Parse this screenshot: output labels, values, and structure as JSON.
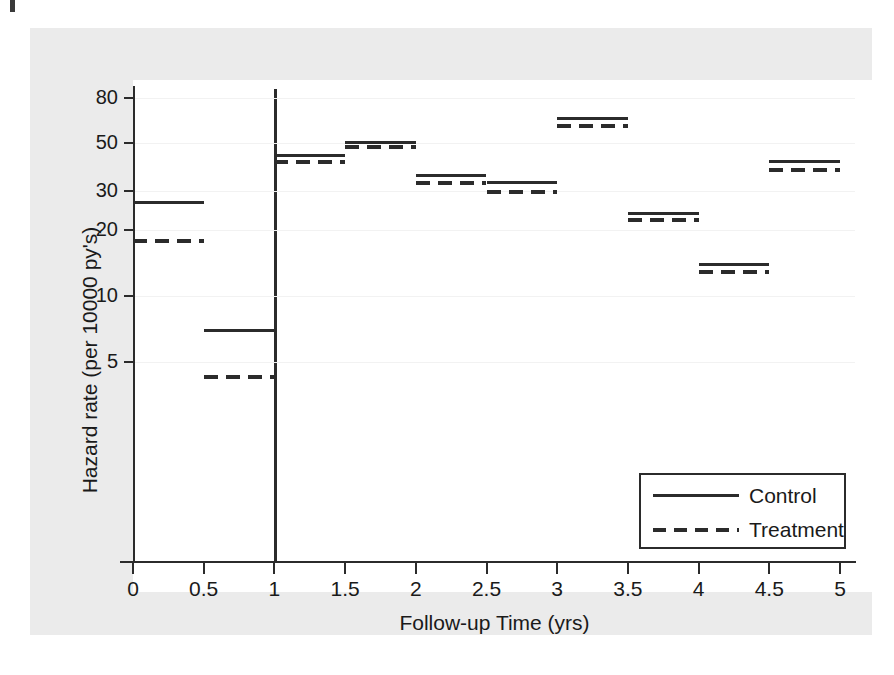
{
  "figure": {
    "background_color": "#ebebeb",
    "plot_background_color": "#ffffff",
    "ink_color": "#2b2b2b"
  },
  "chart_data": {
    "type": "line",
    "subtype": "step-hazard-piecewise",
    "title": "",
    "xlabel": "Follow-up Time (yrs)",
    "ylabel": "Hazard rate (per 10000 py's)",
    "yscale": "log",
    "xlim": [
      0,
      5
    ],
    "ylim": [
      4,
      95
    ],
    "grid": true,
    "x_ticks": [
      "0",
      "0.5",
      "1",
      "1.5",
      "2",
      "2.5",
      "3",
      "3.5",
      "4",
      "4.5",
      "5"
    ],
    "x_tick_values": [
      0,
      0.5,
      1,
      1.5,
      2,
      2.5,
      3,
      3.5,
      4,
      4.5,
      5
    ],
    "y_ticks": [
      "5",
      "10",
      "20",
      "30",
      "50",
      "80"
    ],
    "y_tick_values": [
      5,
      10,
      20,
      30,
      50,
      80
    ],
    "intervals": [
      {
        "start": 0,
        "end": 0.5
      },
      {
        "start": 0.5,
        "end": 1
      },
      {
        "start": 1,
        "end": 1.5
      },
      {
        "start": 1.5,
        "end": 2
      },
      {
        "start": 2,
        "end": 2.5
      },
      {
        "start": 2.5,
        "end": 3
      },
      {
        "start": 3,
        "end": 3.5
      },
      {
        "start": 3.5,
        "end": 4
      },
      {
        "start": 4,
        "end": 4.5
      },
      {
        "start": 4.5,
        "end": 5
      }
    ],
    "series": [
      {
        "name": "Control",
        "style": "solid",
        "values": [
          26.8,
          7.0,
          44.0,
          50.5,
          35.5,
          33.0,
          65.0,
          24.0,
          14.0,
          41.0
        ]
      },
      {
        "name": "Treatment",
        "style": "dashed",
        "values": [
          18.0,
          4.3,
          41.0,
          48.0,
          33.0,
          30.0,
          60.0,
          22.5,
          13.0,
          38.0
        ]
      }
    ],
    "reference_line": {
      "axis": "x",
      "value": 1
    },
    "legend": {
      "position": "bottom-right",
      "entries": [
        {
          "label": "Control",
          "style": "solid"
        },
        {
          "label": "Treatment",
          "style": "dashed"
        }
      ]
    }
  }
}
